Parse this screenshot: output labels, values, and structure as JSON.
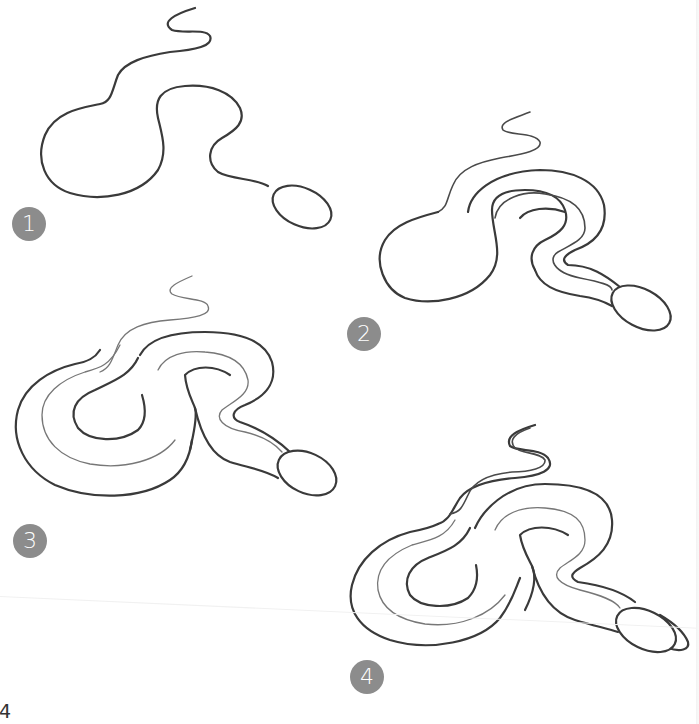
{
  "page": {
    "background": "#ffffff",
    "ink_color": "#3a3a3a",
    "badge_color": "#8c8c8c",
    "page_number": "4"
  },
  "steps": [
    {
      "number": "1",
      "label": "Step 1: draw the outline curve of the snake body with an oval head",
      "badge": {
        "x": 12,
        "y": 207
      }
    },
    {
      "number": "2",
      "label": "Step 2: add a parallel inner line to form the body thickness",
      "badge": {
        "x": 347,
        "y": 317
      }
    },
    {
      "number": "3",
      "label": "Step 3: complete the coiled body outlines and belly line",
      "badge": {
        "x": 13,
        "y": 524
      }
    },
    {
      "number": "4",
      "label": "Step 4: refine the tail, add the rattle tip and clean up lines",
      "badge": {
        "x": 350,
        "y": 660
      }
    }
  ]
}
